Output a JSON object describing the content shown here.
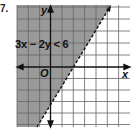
{
  "problem_number": "7.",
  "inequality_label": "3x − 2y < 6",
  "axes": {
    "x_label": "x",
    "y_label": "y",
    "origin_label": "O"
  },
  "graph": {
    "boundary_line": "3x - 2y = 6",
    "boundary_style": "dashed",
    "shaded_side": "left/above (contains origin)",
    "x_intercept": 2,
    "y_intercept": -3,
    "grid_units_x": [
      -3,
      6
    ],
    "grid_units_y": [
      -5,
      5
    ]
  },
  "colors": {
    "shade": "#9a9a9a",
    "grid": "#555555",
    "axis": "#111111"
  }
}
